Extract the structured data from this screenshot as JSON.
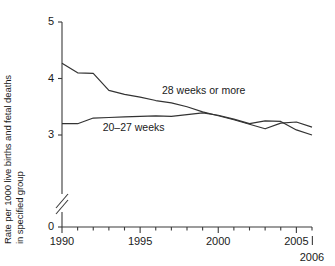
{
  "chart_data": {
    "type": "line",
    "title": "",
    "subtitle": "",
    "xlabel": "",
    "ylabel_line1": "Rate per 1000 live births and fetal deaths",
    "ylabel_line2": "in specified group",
    "grid": false,
    "legend_position": "inline-annotation",
    "y_axis_broken": true,
    "xlim": [
      1990,
      2006
    ],
    "ylim": [
      2.9,
      5.0
    ],
    "yticks": [
      0,
      3,
      4,
      5
    ],
    "ytick_labels": [
      "0",
      "3",
      "4",
      "5"
    ],
    "xticks": [
      1990,
      1991,
      1992,
      1993,
      1994,
      1995,
      1996,
      1997,
      1998,
      1999,
      2000,
      2001,
      2002,
      2003,
      2004,
      2005,
      2006
    ],
    "xtick_labels": [
      "1990",
      "1995",
      "2000",
      "2005",
      "2006"
    ],
    "xtick_label_values": [
      1990,
      1995,
      2000,
      2005,
      2006
    ],
    "x": [
      1990,
      1991,
      1992,
      1993,
      1994,
      1995,
      1996,
      1997,
      1998,
      1999,
      2000,
      2001,
      2002,
      2003,
      2004,
      2005,
      2006
    ],
    "series": [
      {
        "name": "28 weeks or more",
        "label": "28 weeks or more",
        "color": "#333333",
        "values": [
          4.27,
          4.1,
          4.09,
          3.79,
          3.72,
          3.67,
          3.61,
          3.57,
          3.5,
          3.41,
          3.34,
          3.27,
          3.19,
          3.11,
          3.21,
          3.23,
          3.14
        ]
      },
      {
        "name": "20-27 weeks",
        "label": "20–27 weeks",
        "color": "#333333",
        "values": [
          3.2,
          3.2,
          3.3,
          3.31,
          3.32,
          3.33,
          3.34,
          3.33,
          3.36,
          3.39,
          3.35,
          3.28,
          3.2,
          3.25,
          3.24,
          3.09,
          3.0
        ]
      }
    ],
    "annotations": [
      {
        "text": "28 weeks or more",
        "x": 1996.4,
        "y": 3.79
      },
      {
        "text": "20–27 weeks",
        "x": 1992.6,
        "y": 3.14
      }
    ]
  }
}
